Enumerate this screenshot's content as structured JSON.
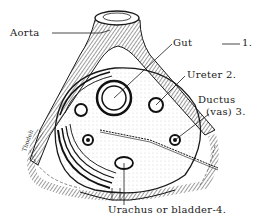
{
  "figure": {
    "type": "anatomical line drawing",
    "ink_color": "#1a1a1a",
    "background": "#ffffff"
  },
  "labels": {
    "aorta": "Aorta",
    "gut": "Gut",
    "gut_number": "1.",
    "ureter": "Ureter 2.",
    "ductus_line1": "Ductus",
    "ductus_line2": "(vas) 3.",
    "urachus": "Urachus or bladder-4."
  },
  "signature": "Thodeh"
}
